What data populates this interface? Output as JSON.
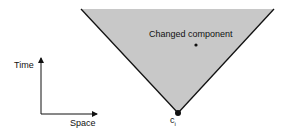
{
  "diagram": {
    "cone_label": "Changed component",
    "vertex_label": "c",
    "vertex_subscript": "i",
    "axes": {
      "y_label": "Time",
      "x_label": "Space"
    },
    "colors": {
      "cone_fill": "#c8c8c8",
      "cone_edge": "#111111",
      "background": "#ffffff"
    }
  }
}
